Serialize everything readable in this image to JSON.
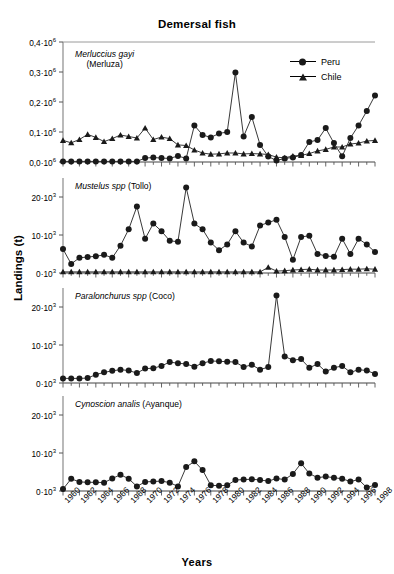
{
  "chart_data": {
    "type": "line",
    "title": "Demersal fish",
    "xlabel": "Years",
    "ylabel": "Landings (t)",
    "grid": false,
    "legend_position": "top-right",
    "legend": [
      {
        "name": "Peru",
        "marker": "filled-circle",
        "color": "#1a1a1a"
      },
      {
        "name": "Chile",
        "marker": "filled-triangle",
        "color": "#1a1a1a"
      }
    ],
    "x": [
      1960,
      1961,
      1962,
      1963,
      1964,
      1965,
      1966,
      1967,
      1968,
      1969,
      1970,
      1971,
      1972,
      1973,
      1974,
      1975,
      1976,
      1977,
      1978,
      1979,
      1980,
      1981,
      1982,
      1983,
      1984,
      1985,
      1986,
      1987,
      1988,
      1989,
      1990,
      1991,
      1992,
      1993,
      1994,
      1995,
      1996,
      1997,
      1998
    ],
    "xtick_labels": [
      "1960",
      "1962",
      "1964",
      "1966",
      "1968",
      "1970",
      "1972",
      "1974",
      "1976",
      "1978",
      "1980",
      "1982",
      "1984",
      "1986",
      "1988",
      "1990",
      "1992",
      "1994",
      "1996",
      "1998"
    ],
    "panels": [
      {
        "id": "merluccius",
        "species": "Merluccius gayi",
        "common_name": "(Merluza)",
        "ylim": [
          0,
          0.4
        ],
        "yticks": [
          0.0,
          0.1,
          0.2,
          0.3,
          0.4
        ],
        "ytick_labels": [
          "0,0·10",
          "0,1·10",
          "0,2·10",
          "0,3·10",
          "0,4·10"
        ],
        "yexponent": "6",
        "unit_scale": 1000000,
        "series": [
          {
            "name": "Peru",
            "values": [
              0.002,
              0.002,
              0.002,
              0.002,
              0.002,
              0.002,
              0.002,
              0.002,
              0.002,
              0.002,
              0.013,
              0.015,
              0.013,
              0.012,
              0.02,
              0.012,
              0.122,
              0.09,
              0.082,
              0.095,
              0.1,
              0.298,
              0.085,
              0.15,
              0.057,
              0.018,
              0.005,
              0.012,
              0.015,
              0.023,
              0.067,
              0.073,
              0.113,
              0.063,
              0.019,
              0.08,
              0.122,
              0.17,
              0.222,
              0.163,
              0.067
            ]
          },
          {
            "name": "Chile",
            "values": [
              0.072,
              0.064,
              0.075,
              0.092,
              0.082,
              0.068,
              0.078,
              0.09,
              0.085,
              0.08,
              0.113,
              0.075,
              0.083,
              0.078,
              0.057,
              0.055,
              0.04,
              0.03,
              0.026,
              0.027,
              0.03,
              0.03,
              0.027,
              0.028,
              0.027,
              0.025,
              0.016,
              0.014,
              0.02,
              0.022,
              0.028,
              0.037,
              0.042,
              0.05,
              0.05,
              0.06,
              0.063,
              0.07,
              0.072,
              0.072,
              0.062
            ]
          }
        ]
      },
      {
        "id": "mustelus",
        "species": "Mustelus spp",
        "common_name": "(Tollo)",
        "ylim": [
          0,
          25
        ],
        "yticks": [
          0,
          10,
          20
        ],
        "ytick_labels": [
          "0·10",
          "10·10",
          "20·10"
        ],
        "yexponent": "3",
        "unit_scale": 1000,
        "series": [
          {
            "name": "Peru",
            "values": [
              6.3,
              2.4,
              4.0,
              4.2,
              4.4,
              4.8,
              4.0,
              7.2,
              11.5,
              17.5,
              9.0,
              13.0,
              11.0,
              8.5,
              8.2,
              22.5,
              13.0,
              11.5,
              8.0,
              6.0,
              7.5,
              11.0,
              8.0,
              7.0,
              12.5,
              13.3,
              14.0,
              9.5,
              3.5,
              9.5,
              9.8,
              5.0,
              4.5,
              4.3,
              9.0,
              5.0,
              9.0,
              7.5,
              5.5
            ]
          },
          {
            "name": "Chile",
            "values": [
              0.3,
              0.3,
              0.3,
              0.3,
              0.3,
              0.3,
              0.3,
              0.3,
              0.3,
              0.3,
              0.3,
              0.3,
              0.3,
              0.3,
              0.3,
              0.3,
              0.3,
              0.3,
              0.3,
              0.3,
              0.3,
              0.3,
              0.3,
              0.3,
              0.3,
              1.5,
              0.5,
              0.6,
              0.8,
              0.9,
              1.0,
              0.8,
              0.8,
              0.8,
              0.9,
              1.0,
              1.0,
              1.1,
              1.0
            ]
          }
        ]
      },
      {
        "id": "paralonchurus",
        "species": "Paralonchurus spp",
        "common_name": "(Coco)",
        "ylim": [
          0,
          25
        ],
        "yticks": [
          0,
          10,
          20
        ],
        "ytick_labels": [
          "0·10",
          "10·10",
          "20·10"
        ],
        "yexponent": "3",
        "unit_scale": 1000,
        "series": [
          {
            "name": "Peru",
            "values": [
              1.2,
              1.2,
              1.2,
              1.3,
              2.2,
              2.8,
              3.2,
              3.5,
              3.3,
              2.6,
              3.8,
              3.9,
              4.5,
              5.5,
              5.2,
              5.0,
              4.3,
              5.2,
              5.8,
              5.7,
              5.6,
              5.5,
              4.2,
              4.8,
              3.5,
              4.2,
              23.0,
              7.0,
              6.0,
              6.3,
              4.0,
              5.0,
              3.0,
              4.0,
              4.5,
              2.8,
              3.5,
              3.3,
              2.4,
              3.0
            ]
          }
        ]
      },
      {
        "id": "cynoscion",
        "species": "Cynoscion analis",
        "common_name": "(Ayanque)",
        "ylim": [
          0,
          25
        ],
        "yticks": [
          0,
          10,
          20
        ],
        "ytick_labels": [
          "0·10",
          "10·10",
          "20·10"
        ],
        "yexponent": "3",
        "unit_scale": 1000,
        "series": [
          {
            "name": "Peru",
            "values": [
              0.5,
              3.2,
              2.4,
              2.3,
              2.3,
              2.2,
              3.3,
              4.3,
              3.2,
              1.2,
              2.4,
              2.5,
              2.6,
              2.2,
              1.2,
              6.3,
              7.8,
              5.5,
              1.5,
              1.4,
              1.5,
              2.9,
              3.0,
              3.1,
              2.9,
              2.6,
              3.3,
              3.0,
              4.5,
              7.3,
              4.6,
              3.5,
              3.8,
              3.5,
              3.2,
              2.5,
              3.0,
              0.9,
              1.6,
              8.0,
              3.2,
              6.8,
              5.3,
              2.5,
              8.8
            ]
          }
        ]
      }
    ]
  }
}
